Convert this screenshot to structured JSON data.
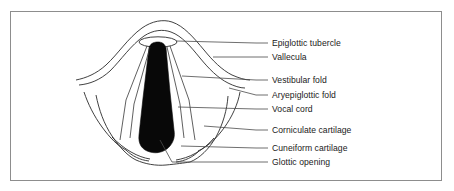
{
  "figure": {
    "kind": "anatomical-diagram",
    "frame_color": "#8d8d8d",
    "background_color": "#ffffff",
    "line_color": "#2b2b2b",
    "glottis_fill_color": "#080808"
  },
  "labels": [
    {
      "id": "epiglottic-tubercle",
      "text": "Epiglottic tubercle",
      "y": 43,
      "leader_from_x": 256,
      "leader_to_x": 175,
      "leader_to_y": 42
    },
    {
      "id": "vallecula",
      "text": "Vallecula",
      "y": 57,
      "leader_from_x": 256,
      "leader_to_x": 212,
      "leader_to_y": 56
    },
    {
      "id": "vestibular-fold",
      "text": "Vestibular fold",
      "y": 80,
      "leader_from_x": 256,
      "leader_to_x": 182,
      "leader_to_y": 76
    },
    {
      "id": "aryepiglottic-fold",
      "text": "Aryepiglottic fold",
      "y": 95,
      "leader_from_x": 256,
      "leader_to_x": 228,
      "leader_to_y": 88
    },
    {
      "id": "vocal-cord",
      "text": "Vocal cord",
      "y": 109,
      "leader_from_x": 256,
      "leader_to_x": 178,
      "leader_to_y": 107
    },
    {
      "id": "corniculate-cartilage",
      "text": "Corniculate cartilage",
      "y": 130,
      "leader_from_x": 256,
      "leader_to_x": 203,
      "leader_to_y": 126
    },
    {
      "id": "cuneiform-cartilage",
      "text": "Cuneiform cartilage",
      "y": 148,
      "leader_from_x": 256,
      "leader_to_x": 180,
      "leader_to_y": 146
    },
    {
      "id": "glottic-opening",
      "text": "Glottic opening",
      "y": 162,
      "leader_from_x": 256,
      "leader_to_x": 162,
      "leader_to_y": 141
    }
  ]
}
